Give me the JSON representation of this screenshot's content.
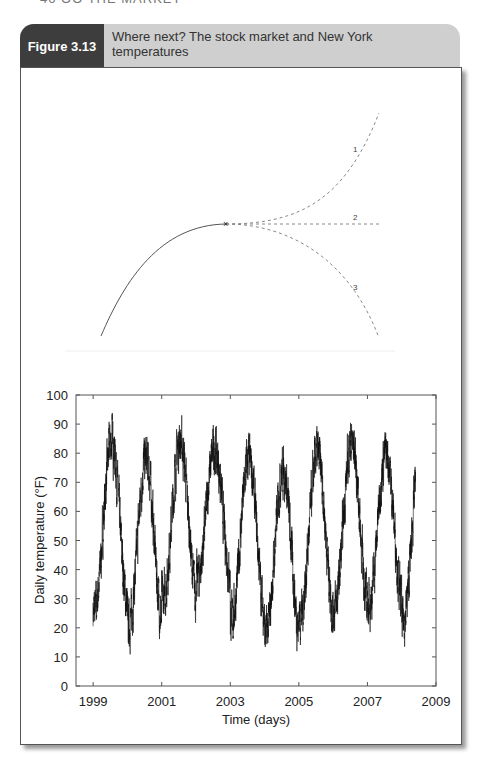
{
  "page": {
    "running_header": "46 OO THE MARKET"
  },
  "figure": {
    "number_label": "Figure 3.13",
    "title": "Where next? The stock market and New York temperatures",
    "colors": {
      "label_bg": "#3d3d3d",
      "header_bg": "#cfcfcf",
      "line": "#222222",
      "dashed": "#888888"
    }
  },
  "diagram": {
    "marker": "×",
    "branches": [
      {
        "id": "1",
        "label": "1",
        "direction": "up"
      },
      {
        "id": "2",
        "label": "2",
        "direction": "flat"
      },
      {
        "id": "3",
        "label": "3",
        "direction": "down"
      }
    ]
  },
  "chart_data": {
    "type": "line",
    "title": "",
    "xlabel": "Time (days)",
    "ylabel": "Daily temperature (°F)",
    "xlim": [
      1998.5,
      2009
    ],
    "ylim": [
      0,
      100
    ],
    "x_ticks": [
      "1999",
      "2001",
      "2003",
      "2005",
      "2007",
      "2009"
    ],
    "x_tick_values": [
      1999,
      2001,
      2003,
      2005,
      2007,
      2009
    ],
    "y_ticks": [
      "0",
      "10",
      "20",
      "30",
      "40",
      "50",
      "60",
      "70",
      "80",
      "90",
      "100"
    ],
    "y_tick_values": [
      0,
      10,
      20,
      30,
      40,
      50,
      60,
      70,
      80,
      90,
      100
    ],
    "grid": false,
    "legend": null,
    "series_range": [
      1999.0,
      2008.4
    ],
    "series": [
      {
        "name": "New York daily temperature",
        "annual_summer_peaks": {
          "years": [
            1999,
            2000,
            2001,
            2002,
            2003,
            2004,
            2005,
            2006,
            2007,
            2008
          ],
          "max_F": [
            92,
            86,
            92,
            89,
            86,
            82,
            88,
            92,
            88,
            88
          ]
        },
        "annual_winter_troughs": {
          "years": [
            1999,
            2000,
            2001,
            2002,
            2003,
            2004,
            2005,
            2006,
            2007,
            2008
          ],
          "min_F": [
            16,
            11,
            20,
            27,
            13,
            8,
            14,
            17,
            18,
            12
          ]
        },
        "seasonal_mean_F": 55,
        "seasonal_amplitude_F": 24,
        "peak_phase": "mid-July",
        "daily_noise_F": 8
      }
    ]
  }
}
